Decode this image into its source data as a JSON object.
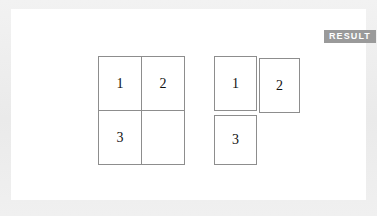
{
  "page": {
    "background_color": "#ededed",
    "panel_color": "#ffffff"
  },
  "badge": {
    "label": "RESULT",
    "background_color": "#9a9a9a",
    "text_color": "#ffffff"
  },
  "diagram": {
    "cell_border_color": "#8d8d8d",
    "cell_fill_color": "#ffffff",
    "groups": [
      {
        "name": "left-grid",
        "layout": "contiguous-2x2",
        "cells": [
          {
            "label": "1",
            "row": 0,
            "col": 0,
            "empty": false
          },
          {
            "label": "2",
            "row": 0,
            "col": 1,
            "empty": false
          },
          {
            "label": "3",
            "row": 1,
            "col": 0,
            "empty": false
          },
          {
            "label": "",
            "row": 1,
            "col": 1,
            "empty": true
          }
        ]
      },
      {
        "name": "right-group",
        "layout": "offset-separated",
        "cells": [
          {
            "label": "1",
            "row": 0,
            "col": 0,
            "empty": false
          },
          {
            "label": "2",
            "row": 0,
            "col": 1,
            "empty": false
          },
          {
            "label": "3",
            "row": 1,
            "col": 0,
            "empty": false
          }
        ]
      }
    ]
  }
}
